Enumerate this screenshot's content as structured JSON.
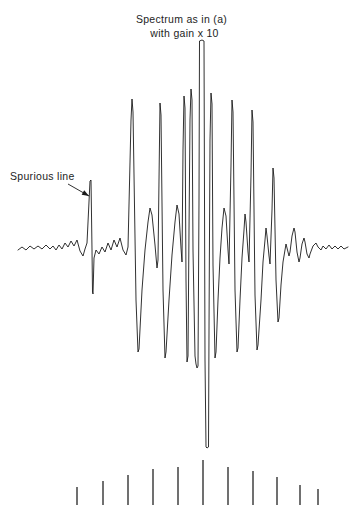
{
  "figure": {
    "caption_line1": "Spectrum as in (a)",
    "caption_line2": "with gain x 10",
    "annotation_label": "Spurious line",
    "stroke_color": "#1a1a1a",
    "background_color": "#ffffff"
  },
  "chart_data": {
    "type": "line",
    "title": "Spectrum as in (a) with gain x 10",
    "subtitle": "",
    "xlabel": "",
    "ylabel": "",
    "grid": false,
    "legend": null,
    "axis_visible": false,
    "xlim": [
      0,
      363
    ],
    "ylim": [
      519,
      0
    ],
    "baseline_y": 248,
    "annotations": [
      {
        "text": "Spurious line",
        "text_x": 12,
        "text_y": 180,
        "arrow_from": [
          68,
          184
        ],
        "arrow_to": [
          89,
          196
        ],
        "target_feature": "narrow-spurious-spike-at-x-91"
      }
    ],
    "series": [
      {
        "name": "spectrum-trace",
        "comment": "Polyline of the recorded spectrum. Baseline noise at y~248; central line is clipped flat-topped from y=40 to y=448.",
        "points": [
          [
            18,
            250
          ],
          [
            22,
            247
          ],
          [
            26,
            250
          ],
          [
            30,
            246
          ],
          [
            34,
            249
          ],
          [
            38,
            246
          ],
          [
            42,
            249
          ],
          [
            46,
            245
          ],
          [
            50,
            249
          ],
          [
            53,
            246
          ],
          [
            56,
            250
          ],
          [
            59,
            245
          ],
          [
            62,
            249
          ],
          [
            65,
            243
          ],
          [
            68,
            247
          ],
          [
            71,
            241
          ],
          [
            74,
            246
          ],
          [
            77,
            240
          ],
          [
            80,
            251
          ],
          [
            83,
            256
          ],
          [
            85,
            249
          ],
          [
            87,
            243
          ],
          [
            90,
            181
          ],
          [
            91,
            180
          ],
          [
            92,
            250
          ],
          [
            92.5,
            292
          ],
          [
            93,
            294
          ],
          [
            94,
            258
          ],
          [
            96,
            250
          ],
          [
            99,
            254
          ],
          [
            102,
            247
          ],
          [
            105,
            252
          ],
          [
            108,
            243
          ],
          [
            111,
            250
          ],
          [
            114,
            240
          ],
          [
            117,
            247
          ],
          [
            120,
            238
          ],
          [
            123,
            250
          ],
          [
            126,
            255
          ],
          [
            128,
            247
          ],
          [
            131,
            120
          ],
          [
            132,
            99
          ],
          [
            133,
            112
          ],
          [
            136,
            300
          ],
          [
            138,
            352
          ],
          [
            139,
            349
          ],
          [
            142,
            290
          ],
          [
            145,
            250
          ],
          [
            148,
            222
          ],
          [
            150,
            208
          ],
          [
            152,
            215
          ],
          [
            155,
            245
          ],
          [
            157,
            268
          ],
          [
            158,
            260
          ],
          [
            159,
            180
          ],
          [
            160,
            103
          ],
          [
            161,
            115
          ],
          [
            163,
            290
          ],
          [
            165,
            358
          ],
          [
            166,
            352
          ],
          [
            169,
            300
          ],
          [
            172,
            255
          ],
          [
            175,
            222
          ],
          [
            177,
            205
          ],
          [
            179,
            214
          ],
          [
            181,
            248
          ],
          [
            182,
            262
          ],
          [
            183,
            150
          ],
          [
            184,
            96
          ],
          [
            185,
            108
          ],
          [
            186,
            280
          ],
          [
            187,
            362
          ],
          [
            188,
            356
          ],
          [
            189,
            230
          ],
          [
            190,
            120
          ],
          [
            191,
            89
          ],
          [
            192,
            100
          ],
          [
            193,
            250
          ],
          [
            195,
            356
          ],
          [
            196,
            364
          ],
          [
            197,
            368
          ],
          [
            198,
            366
          ],
          [
            199,
            200
          ],
          [
            199.5,
            41
          ],
          [
            202,
            40
          ],
          [
            204,
            41
          ],
          [
            204.5,
            200
          ],
          [
            205,
            360
          ],
          [
            206,
            447
          ],
          [
            207,
            448
          ],
          [
            208.5,
            447
          ],
          [
            209,
            330
          ],
          [
            210,
            140
          ],
          [
            211,
            93
          ],
          [
            212,
            104
          ],
          [
            213,
            265
          ],
          [
            215,
            358
          ],
          [
            216,
            352
          ],
          [
            218,
            300
          ],
          [
            220,
            258
          ],
          [
            222,
            228
          ],
          [
            224,
            208
          ],
          [
            226,
            216
          ],
          [
            228,
            250
          ],
          [
            229,
            264
          ],
          [
            231,
            165
          ],
          [
            232,
            100
          ],
          [
            233,
            112
          ],
          [
            235,
            290
          ],
          [
            237,
            352
          ],
          [
            238,
            348
          ],
          [
            240,
            300
          ],
          [
            242,
            258
          ],
          [
            244,
            230
          ],
          [
            245,
            214
          ],
          [
            246,
            222
          ],
          [
            248,
            252
          ],
          [
            249,
            262
          ],
          [
            251,
            175
          ],
          [
            252,
            110
          ],
          [
            253,
            122
          ],
          [
            255,
            295
          ],
          [
            257,
            350
          ],
          [
            258,
            345
          ],
          [
            261,
            300
          ],
          [
            263,
            262
          ],
          [
            265,
            240
          ],
          [
            266,
            228
          ],
          [
            267,
            236
          ],
          [
            269,
            256
          ],
          [
            270,
            264
          ],
          [
            272,
            210
          ],
          [
            273,
            168
          ],
          [
            274,
            178
          ],
          [
            276,
            280
          ],
          [
            278,
            322
          ],
          [
            279,
            318
          ],
          [
            281,
            285
          ],
          [
            283,
            262
          ],
          [
            285,
            250
          ],
          [
            286,
            244
          ],
          [
            287,
            248
          ],
          [
            289,
            256
          ],
          [
            290,
            252
          ],
          [
            292,
            236
          ],
          [
            294,
            228
          ],
          [
            295,
            232
          ],
          [
            297,
            252
          ],
          [
            299,
            262
          ],
          [
            300,
            258
          ],
          [
            302,
            244
          ],
          [
            304,
            238
          ],
          [
            305,
            242
          ],
          [
            307,
            254
          ],
          [
            309,
            258
          ],
          [
            310,
            254
          ],
          [
            313,
            246
          ],
          [
            316,
            243
          ],
          [
            318,
            247
          ],
          [
            321,
            250
          ],
          [
            323,
            246
          ],
          [
            326,
            249
          ],
          [
            329,
            245
          ],
          [
            332,
            249
          ],
          [
            335,
            246
          ],
          [
            338,
            249
          ],
          [
            341,
            246
          ],
          [
            344,
            249
          ],
          [
            348,
            247
          ]
        ]
      }
    ],
    "tick_marks": {
      "comment": "11 calibration / stick-spectrum marks below the trace; height encodes relative line intensity (symmetric multiplet pattern).",
      "baseline_y": 505,
      "x_positions": [
        77,
        103,
        128,
        153,
        178,
        203,
        228,
        253,
        277,
        300,
        318
      ],
      "heights": [
        18,
        24,
        30,
        36,
        38,
        45,
        38,
        34,
        28,
        20,
        16
      ]
    }
  }
}
